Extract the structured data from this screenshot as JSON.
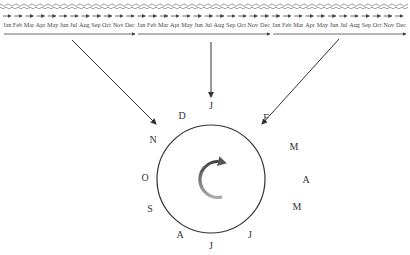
{
  "diagram": {
    "timeline": {
      "segments": [
        {
          "months": [
            "Jan",
            "Feb",
            "Mar",
            "Apr",
            "May",
            "Jun",
            "Jul",
            "Aug",
            "Sep",
            "Oct",
            "Nov",
            "Dec"
          ],
          "x_start": 4,
          "x_end": 135
        },
        {
          "months": [
            "Jan",
            "Feb",
            "Mar",
            "Apr",
            "May",
            "Jun",
            "Jul",
            "Aug",
            "Sep",
            "Oct",
            "Nov",
            "Dec"
          ],
          "x_start": 138,
          "x_end": 270
        },
        {
          "months": [
            "Jan",
            "Feb",
            "Mar",
            "Apr",
            "May",
            "Jun",
            "Jul",
            "Aug",
            "Sep",
            "Oct",
            "Nov",
            "Dec"
          ],
          "x_start": 273,
          "x_end": 406
        }
      ]
    },
    "cycle": {
      "center": [
        211,
        179
      ],
      "radius": 54,
      "labels": [
        {
          "text": "J",
          "x": 211,
          "y": 106
        },
        {
          "text": "F",
          "x": 266,
          "y": 118
        },
        {
          "text": "M",
          "x": 294,
          "y": 147
        },
        {
          "text": "A",
          "x": 306,
          "y": 180
        },
        {
          "text": "M",
          "x": 297,
          "y": 207
        },
        {
          "text": "J",
          "x": 250,
          "y": 235
        },
        {
          "text": "J",
          "x": 211,
          "y": 246
        },
        {
          "text": "A",
          "x": 180,
          "y": 235
        },
        {
          "text": "S",
          "x": 150,
          "y": 209
        },
        {
          "text": "O",
          "x": 145,
          "y": 178
        },
        {
          "text": "N",
          "x": 153,
          "y": 140
        },
        {
          "text": "D",
          "x": 182,
          "y": 116
        }
      ],
      "rotation_arrow": "clockwise"
    },
    "connectors": [
      {
        "from": [
          72,
          40
        ],
        "to": [
          156,
          124
        ]
      },
      {
        "from": [
          211,
          42
        ],
        "to": [
          211,
          97
        ]
      },
      {
        "from": [
          339,
          39
        ],
        "to": [
          262,
          124
        ]
      }
    ],
    "colors": {
      "line": "#333333",
      "arrow_gray": "#666666",
      "wave": "#777777"
    }
  }
}
